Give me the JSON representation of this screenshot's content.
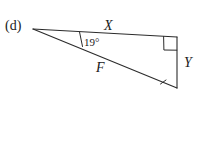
{
  "figure": {
    "part_label": "(d)",
    "type": "right-triangle-diagram",
    "background_color": "#ffffff",
    "stroke_color": "#2b2b2b"
  },
  "labels": {
    "side_top": "X",
    "side_hypotenuse": "F",
    "side_vertical": "Y",
    "angle": "19°"
  },
  "geometry": {
    "vertices": {
      "apex_left": {
        "x": 33,
        "y": 29
      },
      "top_right": {
        "x": 177,
        "y": 37
      },
      "bottom_right": {
        "x": 177,
        "y": 88
      }
    },
    "right_angle_marker_at": "top_right",
    "angle_marker_at": "apex_left",
    "angle_value_degrees": 19,
    "tick_mark_on": "side_hypotenuse"
  }
}
